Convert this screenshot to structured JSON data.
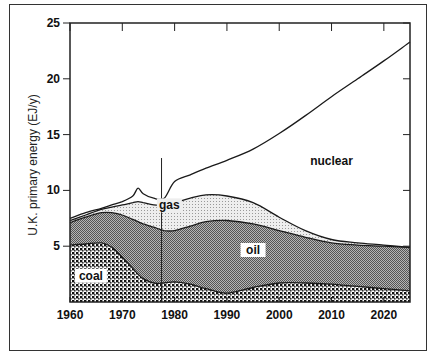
{
  "chart_data": {
    "type": "area",
    "title": "",
    "xlabel": "",
    "ylabel": "U.K. primary energy (EJ/y)",
    "xlim": [
      1960,
      2025
    ],
    "ylim": [
      0,
      25
    ],
    "x_ticks": [
      "1960",
      "1970",
      "1980",
      "1990",
      "2000",
      "2010",
      "2020"
    ],
    "y_ticks": [
      "5",
      "10",
      "15",
      "20",
      "25"
    ],
    "grid": false,
    "stacked": true,
    "vertical_marker_year": 1977.5,
    "x": [
      1960,
      1963,
      1966,
      1968,
      1970,
      1972,
      1973,
      1974,
      1976,
      1978,
      1980,
      1983,
      1986,
      1990,
      1995,
      2000,
      2005,
      2010,
      2015,
      2020,
      2025
    ],
    "series": [
      {
        "name": "coal",
        "label": "coal",
        "pattern": "coarse-dots",
        "cumulative_top": [
          5.1,
          5.2,
          5.3,
          4.9,
          4.0,
          3.0,
          2.5,
          2.1,
          1.7,
          1.7,
          1.8,
          1.6,
          1.2,
          0.8,
          1.3,
          1.7,
          1.7,
          1.6,
          1.4,
          1.2,
          1.0
        ]
      },
      {
        "name": "oil",
        "label": "oil",
        "pattern": "dark-fine-dots",
        "cumulative_top": [
          7.1,
          7.6,
          8.0,
          8.0,
          7.8,
          7.4,
          7.2,
          7.0,
          6.7,
          6.4,
          6.4,
          6.8,
          7.2,
          7.3,
          7.0,
          6.4,
          5.8,
          5.3,
          5.1,
          5.0,
          4.9
        ]
      },
      {
        "name": "gas",
        "label": "gas",
        "pattern": "light-fine-dots",
        "cumulative_top": [
          7.3,
          7.8,
          8.3,
          8.5,
          8.7,
          8.9,
          9.0,
          8.9,
          8.7,
          8.7,
          8.9,
          9.3,
          9.6,
          9.5,
          8.9,
          7.6,
          6.4,
          5.6,
          5.3,
          5.1,
          4.9
        ]
      },
      {
        "name": "nuclear",
        "label": "nuclear",
        "pattern": "none",
        "cumulative_top": [
          7.5,
          8.0,
          8.4,
          8.7,
          9.0,
          9.5,
          10.2,
          9.7,
          9.3,
          9.3,
          10.8,
          11.4,
          12.0,
          12.7,
          13.7,
          15.1,
          16.7,
          18.4,
          20.0,
          21.6,
          23.3
        ]
      }
    ],
    "annotations": [
      {
        "text": "coal",
        "year": 1964,
        "value": 2.0
      },
      {
        "text": "oil",
        "year": 1995,
        "value": 4.3
      },
      {
        "text": "gas",
        "year": 1979,
        "value": 8.3
      },
      {
        "text": "nuclear",
        "year": 2010,
        "value": 12.3
      }
    ]
  }
}
